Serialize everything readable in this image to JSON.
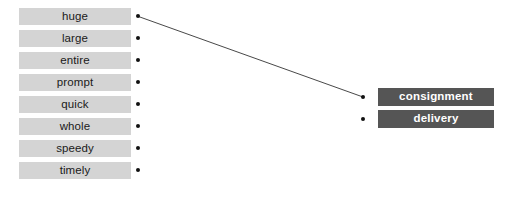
{
  "canvas": {
    "width": 506,
    "height": 203,
    "background_color": "#ffffff"
  },
  "colors": {
    "source_chip_background": "#d4d4d4",
    "source_chip_text": "#1a1a1a",
    "target_chip_background": "#555555",
    "target_chip_text": "#ffffff",
    "node_dot": "#111111",
    "edge_line": "#333333"
  },
  "source_column": {
    "items": [
      {
        "label": "huge"
      },
      {
        "label": "large"
      },
      {
        "label": "entire"
      },
      {
        "label": "prompt"
      },
      {
        "label": "quick"
      },
      {
        "label": "whole"
      },
      {
        "label": "speedy"
      },
      {
        "label": "timely"
      }
    ]
  },
  "target_column": {
    "items": [
      {
        "label": "consignment"
      },
      {
        "label": "delivery"
      }
    ]
  },
  "edges": [
    {
      "from": "huge",
      "to": "consignment",
      "x1": 138.5,
      "y1": 16.5,
      "x2": 363,
      "y2": 97
    }
  ]
}
